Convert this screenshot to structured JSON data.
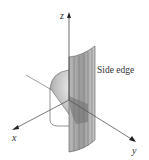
{
  "figure": {
    "type": "3d-surface-diagram",
    "axes": {
      "x": {
        "label": "x"
      },
      "y": {
        "label": "y"
      },
      "z": {
        "label": "z"
      }
    },
    "annotations": [
      {
        "text": "Side edge"
      }
    ],
    "colors": {
      "axis": "#444444",
      "surface_light": "#d9d9d9",
      "surface_mid": "#a8a8a8",
      "surface_dark": "#7a7a7a",
      "outline": "#555555",
      "background": "#ffffff"
    }
  }
}
